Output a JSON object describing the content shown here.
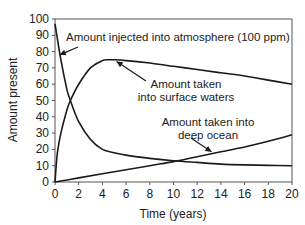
{
  "chart_data": {
    "type": "line",
    "title": "",
    "xlabel": "Time (years)",
    "ylabel": "Amount present",
    "xlim": [
      0,
      20
    ],
    "ylim": [
      0,
      100
    ],
    "xticks": [
      0,
      2,
      4,
      6,
      8,
      10,
      12,
      14,
      16,
      18,
      20
    ],
    "yticks": [
      0,
      10,
      20,
      30,
      40,
      50,
      60,
      70,
      80,
      90,
      100
    ],
    "grid": false,
    "legend": "none (curves labeled by annotations with arrows)",
    "series": [
      {
        "name": "Amount injected into atmosphere (100 ppm)",
        "x": [
          0,
          0.5,
          1,
          1.3,
          2,
          3,
          4,
          5,
          6,
          8,
          10,
          12,
          14,
          16,
          18,
          20
        ],
        "y": [
          97,
          75,
          57,
          50,
          37,
          26,
          20,
          18,
          16.5,
          14.5,
          13,
          12,
          11,
          10.5,
          10.2,
          10
        ]
      },
      {
        "name": "Amount taken into surface waters",
        "x": [
          0,
          0.2,
          0.5,
          1,
          1.3,
          2,
          3,
          4,
          4.5,
          5,
          6,
          8,
          10,
          12,
          14,
          16,
          18,
          20
        ],
        "y": [
          0,
          18,
          30,
          44,
          50,
          60,
          70,
          74.5,
          75,
          75,
          74.5,
          73,
          71,
          69,
          67,
          65,
          62.5,
          60
        ]
      },
      {
        "name": "Amount taken into deep ocean",
        "x": [
          0,
          2,
          4,
          6,
          8,
          10,
          12,
          14,
          16,
          18,
          20
        ],
        "y": [
          0,
          2.5,
          5,
          7.5,
          10,
          12.5,
          15.5,
          18.5,
          21.5,
          25,
          29
        ]
      }
    ],
    "annotations": [
      {
        "text": "Amount injected into atmosphere (100 ppm)",
        "lines": [
          "Amount injected into atmosphere (100 ppm)"
        ],
        "arrow_to": [
          0.4,
          78
        ]
      },
      {
        "text": "Amount taken into surface waters",
        "lines": [
          "Amount taken",
          "into surface waters"
        ],
        "arrow_to": [
          5.2,
          74
        ]
      },
      {
        "text": "Amount taken into deep ocean",
        "lines": [
          "Amount taken into",
          "deep ocean"
        ],
        "arrow_to": [
          13.2,
          18.5
        ]
      }
    ]
  },
  "colors": {
    "line": "#1a1a1a",
    "axis": "#555555",
    "background": "#ffffff"
  }
}
